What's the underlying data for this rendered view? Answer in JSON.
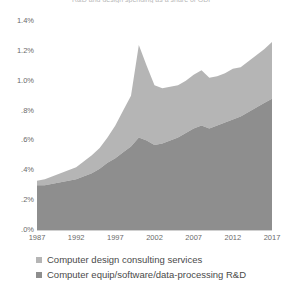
{
  "chart_data": {
    "type": "area",
    "stacked": true,
    "title": "R&D and design spending as a share of GDP",
    "xlabel": "",
    "ylabel": "",
    "xlim": [
      1987,
      2017
    ],
    "ylim": [
      0.0,
      1.4
    ],
    "grid": false,
    "legend_position": "bottom-left",
    "x": [
      1987,
      1988,
      1989,
      1990,
      1991,
      1992,
      1993,
      1994,
      1995,
      1996,
      1997,
      1998,
      1999,
      2000,
      2001,
      2002,
      2003,
      2004,
      2005,
      2006,
      2007,
      2008,
      2009,
      2010,
      2011,
      2012,
      2013,
      2014,
      2015,
      2016,
      2017
    ],
    "y_tick_labels": [
      "1.4%",
      "1.2%",
      "1.0%",
      ".8%",
      ".6%",
      ".4%",
      ".2%",
      ".0%"
    ],
    "y_tick_values": [
      1.4,
      1.2,
      1.0,
      0.8,
      0.6,
      0.4,
      0.2,
      0.0
    ],
    "x_tick_labels": [
      "1987",
      "1992",
      "1997",
      "2002",
      "2007",
      "2012",
      "2017"
    ],
    "x_tick_values": [
      1987,
      1992,
      1997,
      2002,
      2007,
      2012,
      2017
    ],
    "series": [
      {
        "name": "Computer equip/software/data-processing R&D",
        "color": "#8e8e8e",
        "values": [
          0.3,
          0.3,
          0.31,
          0.32,
          0.33,
          0.34,
          0.36,
          0.38,
          0.41,
          0.45,
          0.48,
          0.52,
          0.56,
          0.62,
          0.6,
          0.57,
          0.58,
          0.6,
          0.62,
          0.65,
          0.68,
          0.7,
          0.68,
          0.7,
          0.72,
          0.74,
          0.76,
          0.79,
          0.82,
          0.85,
          0.88
        ]
      },
      {
        "name": "Computer design consulting services",
        "color": "#b5b5b5",
        "values": [
          0.03,
          0.04,
          0.05,
          0.06,
          0.07,
          0.08,
          0.1,
          0.12,
          0.14,
          0.17,
          0.22,
          0.28,
          0.34,
          0.62,
          0.5,
          0.4,
          0.37,
          0.36,
          0.35,
          0.35,
          0.36,
          0.37,
          0.34,
          0.33,
          0.33,
          0.34,
          0.33,
          0.34,
          0.35,
          0.36,
          0.38
        ]
      }
    ],
    "totals": [
      0.33,
      0.34,
      0.36,
      0.38,
      0.4,
      0.42,
      0.46,
      0.5,
      0.55,
      0.62,
      0.7,
      0.8,
      0.9,
      1.24,
      1.1,
      0.97,
      0.95,
      0.96,
      0.97,
      1.0,
      1.04,
      1.07,
      1.02,
      1.03,
      1.05,
      1.08,
      1.09,
      1.13,
      1.17,
      1.21,
      1.26
    ]
  },
  "legend": {
    "items": [
      {
        "label": "Computer design consulting services",
        "color": "#b5b5b5"
      },
      {
        "label": "Computer equip/software/data-processing R&D",
        "color": "#8e8e8e"
      }
    ]
  }
}
